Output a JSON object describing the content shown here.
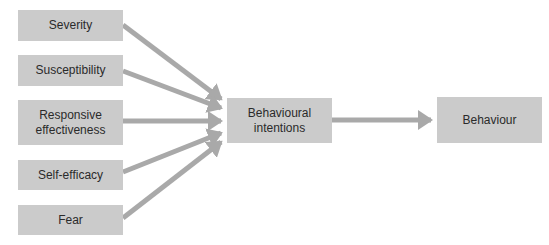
{
  "diagram": {
    "type": "flowchart",
    "colors": {
      "box_fill": "#cbcbcb",
      "arrow": "#a9a9a9",
      "text": "#2a2a2a",
      "background": "#ffffff"
    },
    "inputs": [
      {
        "id": "severity",
        "label": "Severity"
      },
      {
        "id": "susceptibility",
        "label": "Susceptibility"
      },
      {
        "id": "responsive-effectiveness",
        "label": "Responsive effectiveness"
      },
      {
        "id": "self-efficacy",
        "label": "Self-efficacy"
      },
      {
        "id": "fear",
        "label": "Fear"
      }
    ],
    "intermediate": {
      "id": "behavioural-intentions",
      "label": "Behavioural intentions"
    },
    "output": {
      "id": "behaviour",
      "label": "Behaviour"
    },
    "edges": [
      {
        "from": "severity",
        "to": "behavioural-intentions"
      },
      {
        "from": "susceptibility",
        "to": "behavioural-intentions"
      },
      {
        "from": "responsive-effectiveness",
        "to": "behavioural-intentions"
      },
      {
        "from": "self-efficacy",
        "to": "behavioural-intentions"
      },
      {
        "from": "fear",
        "to": "behavioural-intentions"
      },
      {
        "from": "behavioural-intentions",
        "to": "behaviour"
      }
    ]
  }
}
